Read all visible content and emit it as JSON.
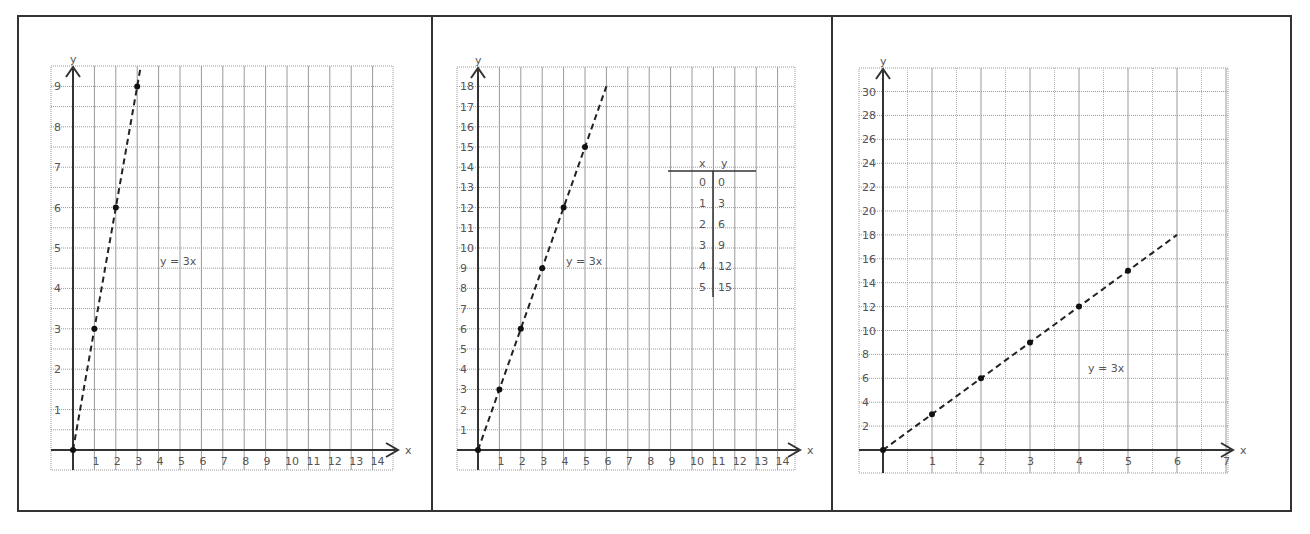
{
  "chart_data": [
    {
      "type": "line",
      "title": "",
      "equation_label": "y = 3x",
      "xlabel": "x",
      "ylabel": "y",
      "x_ticks": [
        1,
        2,
        3,
        4,
        5,
        6,
        7,
        8,
        9,
        10,
        11,
        12,
        13,
        14
      ],
      "y_ticks": [
        1,
        2,
        3,
        4,
        5,
        6,
        7,
        8,
        9
      ],
      "xlim": [
        0,
        14.9
      ],
      "ylim": [
        0,
        9.4
      ],
      "grid": true,
      "line_style": "dashed",
      "series": [
        {
          "name": "y = 3x",
          "x": [
            0,
            1,
            2,
            3
          ],
          "y": [
            0,
            3,
            6,
            9
          ]
        }
      ],
      "line_extent": {
        "x": [
          0,
          3.15
        ],
        "y": [
          0,
          9.45
        ]
      }
    },
    {
      "type": "line",
      "title": "",
      "equation_label": "y = 3x",
      "xlabel": "x",
      "ylabel": "y",
      "x_ticks": [
        1,
        2,
        3,
        4,
        5,
        6,
        7,
        8,
        9,
        10,
        11,
        12,
        13,
        14
      ],
      "y_ticks": [
        1,
        2,
        3,
        4,
        5,
        6,
        7,
        8,
        9,
        10,
        11,
        12,
        13,
        14,
        15,
        16,
        17,
        18
      ],
      "xlim": [
        0,
        14.9
      ],
      "ylim": [
        0,
        18.8
      ],
      "grid": true,
      "line_style": "dashed",
      "series": [
        {
          "name": "y = 3x",
          "x": [
            0,
            1,
            2,
            3,
            4,
            5
          ],
          "y": [
            0,
            3,
            6,
            9,
            12,
            15
          ]
        }
      ],
      "line_extent": {
        "x": [
          0,
          6
        ],
        "y": [
          0,
          18
        ]
      },
      "table": {
        "headers": [
          "x",
          "y"
        ],
        "rows": [
          [
            "0",
            "0"
          ],
          [
            "1",
            "3"
          ],
          [
            "2",
            "6"
          ],
          [
            "3",
            "9"
          ],
          [
            "4",
            "12"
          ],
          [
            "5",
            "15"
          ]
        ]
      }
    },
    {
      "type": "line",
      "title": "",
      "equation_label": "y = 3x",
      "xlabel": "x",
      "ylabel": "y",
      "x_ticks": [
        1,
        2,
        3,
        4,
        5,
        6,
        7
      ],
      "y_ticks": [
        2,
        4,
        6,
        8,
        10,
        12,
        14,
        16,
        18,
        20,
        22,
        24,
        26,
        28,
        30
      ],
      "xlim": [
        0,
        7.3
      ],
      "ylim": [
        0,
        31
      ],
      "grid": true,
      "line_style": "dashed",
      "series": [
        {
          "name": "y = 3x",
          "x": [
            0,
            1,
            2,
            3,
            4,
            5
          ],
          "y": [
            0,
            3,
            6,
            9,
            12,
            15
          ]
        }
      ],
      "line_extent": {
        "x": [
          0,
          6
        ],
        "y": [
          0,
          18
        ]
      }
    }
  ]
}
